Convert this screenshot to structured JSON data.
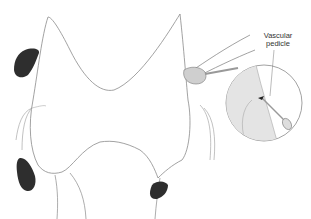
{
  "figure": {
    "labels": {
      "vascular_pedicle": [
        "Vascular",
        "pedicle"
      ]
    },
    "colors": {
      "outline": "#8a8a8a",
      "parathyroid": "#2e2e2e",
      "background": "#ffffff",
      "inset_fill": "#e4e4e4"
    }
  }
}
